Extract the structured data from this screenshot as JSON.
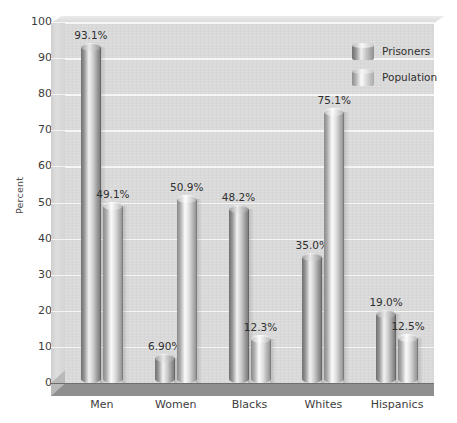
{
  "chart_data": {
    "type": "bar",
    "title": "",
    "subtitle": "",
    "xlabel": "",
    "ylabel": "Percent",
    "ylim": [
      0,
      100
    ],
    "yticks": [
      0,
      10,
      20,
      30,
      40,
      50,
      60,
      70,
      80,
      90,
      100
    ],
    "ytick_labels": [
      "0",
      "10",
      "20",
      "30",
      "40",
      "50",
      "60",
      "70",
      "80",
      "90",
      "100"
    ],
    "grid": true,
    "legend_position": "top-right",
    "categories": [
      "Men",
      "Women",
      "Blacks",
      "Whites",
      "Hispanics"
    ],
    "series": [
      {
        "name": "Prisoners",
        "color": "#9a9a9a",
        "values": [
          93.1,
          6.9,
          48.2,
          35.0,
          19.0
        ],
        "labels": [
          "93.1%",
          "6.90%",
          "48.2%",
          "35.0%",
          "19.0%"
        ]
      },
      {
        "name": "Population",
        "color": "#cccccc",
        "values": [
          49.1,
          50.9,
          12.3,
          75.1,
          12.5
        ],
        "labels": [
          "49.1%",
          "50.9%",
          "12.3%",
          "75.1%",
          "12.5%"
        ]
      }
    ]
  },
  "legend": {
    "items": [
      {
        "label": "Prisoners",
        "swatch": "prisoners-cylinder-swatch"
      },
      {
        "label": "Population",
        "swatch": "population-cylinder-swatch"
      }
    ]
  },
  "colors": {
    "plot_background": "#d9d9d9",
    "gridline": "#f6f6f6",
    "floor": "#8f8f8f",
    "sidewall": "#d4d4d4",
    "text": "#3d3d3d",
    "page_background": "#ffffff"
  }
}
